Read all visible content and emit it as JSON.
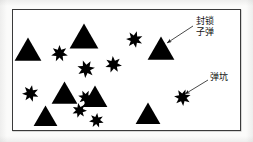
{
  "figure": {
    "type": "schematic-scatter-diagram",
    "background_color": "#ffffff",
    "border_color": "#3a3a3a",
    "shape_color": "#000000",
    "frame": {
      "x": 12,
      "y": 9,
      "width": 229,
      "height": 122
    }
  },
  "legend_note": {
    "triangle_meaning_label": "封锁子弹",
    "star_meaning_label": "弹坑"
  },
  "annotations": [
    {
      "id": "annotation-blocking-bullets",
      "name": "blocking-bullets-annotation",
      "text_lines": [
        "封锁",
        "子弹"
      ],
      "text_full": "封锁子弹",
      "text_x": 196,
      "text_y": 16,
      "arrow": {
        "x1": 193,
        "y1": 26,
        "x2": 167,
        "y2": 43
      },
      "points_to": "triangle"
    },
    {
      "id": "annotation-crater",
      "name": "crater-annotation",
      "text_lines": [
        "弹坑"
      ],
      "text_full": "弹坑",
      "text_x": 210,
      "text_y": 72,
      "arrow": {
        "x1": 208,
        "y1": 80,
        "x2": 185,
        "y2": 94
      },
      "points_to": "star"
    }
  ],
  "shapes": {
    "triangles": [
      {
        "name": "triangle-1",
        "cx": 28,
        "cy": 49,
        "size": 28
      },
      {
        "name": "triangle-2",
        "cx": 84,
        "cy": 36,
        "size": 30
      },
      {
        "name": "triangle-3",
        "cx": 161,
        "cy": 48,
        "size": 28
      },
      {
        "name": "triangle-4",
        "cx": 64,
        "cy": 93,
        "size": 27
      },
      {
        "name": "triangle-5",
        "cx": 95,
        "cy": 96,
        "size": 26
      },
      {
        "name": "triangle-6",
        "cx": 45,
        "cy": 116,
        "size": 25
      },
      {
        "name": "triangle-7",
        "cx": 148,
        "cy": 113,
        "size": 26
      }
    ],
    "stars": [
      {
        "name": "star-1",
        "cx": 59,
        "cy": 53,
        "size": 17
      },
      {
        "name": "star-2",
        "cx": 134,
        "cy": 39,
        "size": 17
      },
      {
        "name": "star-3",
        "cx": 86,
        "cy": 69,
        "size": 18
      },
      {
        "name": "star-4",
        "cx": 113,
        "cy": 64,
        "size": 17
      },
      {
        "name": "star-5",
        "cx": 30,
        "cy": 93,
        "size": 17
      },
      {
        "name": "star-6",
        "cx": 85,
        "cy": 97,
        "size": 15
      },
      {
        "name": "star-7",
        "cx": 79,
        "cy": 110,
        "size": 15
      },
      {
        "name": "star-8",
        "cx": 96,
        "cy": 120,
        "size": 15
      },
      {
        "name": "star-9",
        "cx": 182,
        "cy": 97,
        "size": 17
      }
    ]
  }
}
